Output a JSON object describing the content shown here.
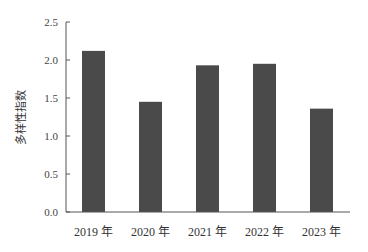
{
  "chart_data": {
    "type": "bar",
    "title": "",
    "xlabel": "",
    "ylabel": "多样性指数",
    "categories": [
      "2019 年",
      "2020 年",
      "2021 年",
      "2022 年",
      "2023 年"
    ],
    "values": [
      2.12,
      1.45,
      1.93,
      1.95,
      1.36
    ],
    "ylim": [
      0,
      2.5
    ],
    "yticks": [
      "0.0",
      "0.5",
      "1.0",
      "1.5",
      "2.0",
      "2.5"
    ],
    "ytick_values": [
      0,
      0.5,
      1.0,
      1.5,
      2.0,
      2.5
    ],
    "grid": false,
    "legend": null,
    "bar_color": "#4a4a4a",
    "axis_color": "#555555"
  }
}
